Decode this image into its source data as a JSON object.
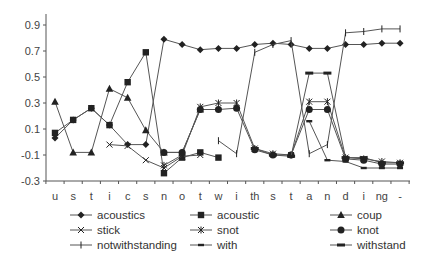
{
  "chart_data": {
    "type": "line",
    "title": "",
    "xlabel": "",
    "ylabel": "",
    "ylim": [
      -0.3,
      1.0
    ],
    "yticks": [
      "0.9",
      "0.7",
      "0.5",
      "0.3",
      "0.1",
      "-0.1",
      "-0.3"
    ],
    "grid": false,
    "legend_position": "bottom",
    "categories": [
      "u",
      "s",
      "t",
      "i",
      "c",
      "s",
      "n",
      "o",
      "t",
      "w",
      "i",
      "th",
      "s",
      "t",
      "a",
      "n",
      "d",
      "i",
      "ng",
      "-"
    ],
    "series": [
      {
        "name": "acoustics",
        "marker": "diamond",
        "values": [
          0.03,
          0.17,
          0.26,
          0.13,
          -0.02,
          -0.02,
          0.79,
          0.75,
          0.71,
          0.72,
          0.72,
          0.75,
          0.76,
          0.75,
          0.72,
          0.72,
          0.75,
          0.75,
          0.76,
          0.76
        ]
      },
      {
        "name": "acoustic",
        "marker": "square",
        "values": [
          0.07,
          0.17,
          0.26,
          0.13,
          0.46,
          0.69,
          -0.24,
          -0.12,
          -0.08,
          -0.12,
          null,
          null,
          null,
          null,
          null,
          null,
          null,
          null,
          null,
          null
        ]
      },
      {
        "name": "coup",
        "marker": "triangle",
        "values": [
          0.31,
          -0.08,
          -0.08,
          0.41,
          0.34,
          0.09,
          -0.08,
          -0.08,
          0.25,
          null,
          null,
          null,
          null,
          null,
          null,
          null,
          null,
          null,
          null,
          null
        ]
      },
      {
        "name": "stick",
        "marker": "x",
        "values": [
          null,
          null,
          null,
          -0.02,
          -0.03,
          -0.14,
          -0.2,
          -0.11,
          -0.1,
          null,
          null,
          null,
          null,
          null,
          null,
          null,
          null,
          null,
          null,
          null
        ]
      },
      {
        "name": "snot",
        "marker": "asterisk",
        "values": [
          null,
          null,
          null,
          null,
          null,
          null,
          -0.18,
          -0.1,
          0.27,
          0.3,
          0.3,
          -0.05,
          -0.09,
          -0.1,
          0.31,
          0.31,
          -0.12,
          -0.13,
          -0.15,
          -0.16
        ]
      },
      {
        "name": "knot",
        "marker": "circle",
        "values": [
          null,
          null,
          null,
          null,
          null,
          null,
          -0.08,
          -0.08,
          0.25,
          0.25,
          0.26,
          -0.06,
          -0.1,
          -0.1,
          0.25,
          0.25,
          -0.13,
          -0.14,
          -0.17,
          -0.17
        ]
      },
      {
        "name": "notwithstanding",
        "marker": "plus",
        "values": [
          null,
          null,
          null,
          null,
          null,
          null,
          null,
          null,
          null,
          0.01,
          -0.09,
          0.69,
          0.75,
          0.78,
          -0.09,
          -0.02,
          0.84,
          0.85,
          0.87,
          0.87
        ]
      },
      {
        "name": "with",
        "marker": "dash",
        "values": [
          null,
          null,
          null,
          null,
          null,
          null,
          null,
          null,
          null,
          null,
          null,
          null,
          null,
          null,
          0.16,
          -0.14,
          -0.15,
          -0.2,
          -0.2,
          -0.2
        ]
      },
      {
        "name": "withstand",
        "marker": "bar",
        "values": [
          null,
          null,
          null,
          null,
          null,
          null,
          null,
          null,
          null,
          null,
          null,
          -0.05,
          -0.1,
          -0.11,
          0.53,
          0.53,
          -0.12,
          -0.12,
          -0.16,
          -0.16
        ]
      }
    ]
  }
}
